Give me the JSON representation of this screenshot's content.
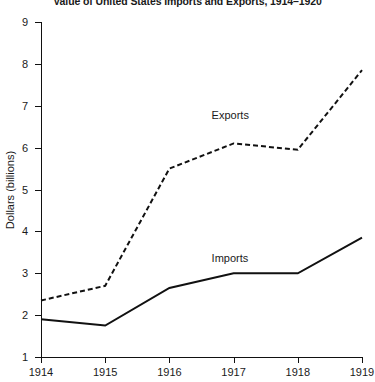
{
  "chart_data": {
    "type": "line",
    "title": "Value of United States Imports and Exports, 1914–1920",
    "xlabel": "",
    "ylabel": "Dollars (billions)",
    "categories": [
      "1914",
      "1915",
      "1916",
      "1917",
      "1918",
      "1919"
    ],
    "x": [
      1914,
      1915,
      1916,
      1917,
      1918,
      1919
    ],
    "xlim": [
      1914,
      1919
    ],
    "ylim": [
      1,
      9
    ],
    "y_ticks": [
      1,
      2,
      3,
      4,
      5,
      6,
      7,
      8,
      9
    ],
    "y_tick_labels": [
      "1",
      "2",
      "3",
      "4",
      "5",
      "6",
      "7",
      "8",
      "9"
    ],
    "grid": false,
    "legend": "inline-annotations",
    "series": [
      {
        "name": "Exports",
        "style": "dashed",
        "color": "#111111",
        "values": [
          2.35,
          2.7,
          5.5,
          6.1,
          5.95,
          7.85
        ],
        "label_x": 1917.0,
        "label_y": 6.75
      },
      {
        "name": "Imports",
        "style": "solid",
        "color": "#111111",
        "values": [
          1.9,
          1.75,
          2.65,
          3.0,
          3.0,
          3.85
        ],
        "label_x": 1917.0,
        "label_y": 3.35
      }
    ],
    "annotations": [
      {
        "text": "Exports",
        "series": "Exports"
      },
      {
        "text": "Imports",
        "series": "Imports"
      }
    ]
  },
  "colors": {
    "ink": "#111111",
    "background": "#ffffff"
  }
}
